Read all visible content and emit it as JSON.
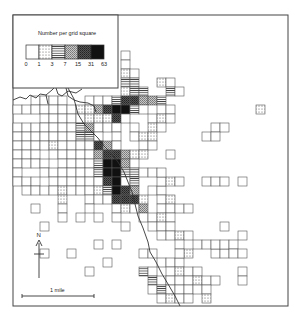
{
  "legend": {
    "title": "Number per grid square",
    "ticks": [
      "0",
      "1",
      "3",
      "7",
      "15",
      "31",
      "63"
    ],
    "classes": [
      {
        "range": "0",
        "pattern": "empty"
      },
      {
        "range": "1-3",
        "pattern": "dots"
      },
      {
        "range": "3-7",
        "pattern": "hlines"
      },
      {
        "range": "7-15",
        "pattern": "crosshatch-light"
      },
      {
        "range": "15-31",
        "pattern": "crosshatch-dark"
      },
      {
        "range": "31-63",
        "pattern": "solid"
      }
    ]
  },
  "north_label": "N",
  "scale_label": "1 mile",
  "grid": {
    "origin_x": 13,
    "origin_y": 15,
    "cell": 9,
    "cells": [
      [
        9,
        2,
        0
      ],
      [
        10,
        2,
        1
      ],
      [
        10,
        3,
        0
      ],
      [
        11,
        3,
        1
      ],
      [
        10,
        4,
        0
      ],
      [
        11,
        4,
        0
      ],
      [
        12,
        4,
        0
      ],
      [
        6,
        3,
        0
      ],
      [
        6,
        5,
        0
      ],
      [
        7,
        5,
        0
      ],
      [
        8,
        5,
        0
      ],
      [
        10,
        5,
        0
      ],
      [
        11,
        5,
        0
      ],
      [
        12,
        5,
        0
      ],
      [
        5,
        6,
        0
      ],
      [
        8,
        6,
        0
      ],
      [
        9,
        6,
        0
      ],
      [
        10,
        6,
        0
      ],
      [
        11,
        6,
        0
      ],
      [
        12,
        6,
        1
      ],
      [
        13,
        6,
        0
      ],
      [
        9,
        7,
        0
      ],
      [
        10,
        7,
        0
      ],
      [
        11,
        7,
        1
      ],
      [
        12,
        7,
        2
      ],
      [
        13,
        7,
        2
      ],
      [
        16,
        7,
        1
      ],
      [
        17,
        7,
        0
      ],
      [
        9,
        8,
        0
      ],
      [
        10,
        8,
        1
      ],
      [
        11,
        8,
        0
      ],
      [
        12,
        8,
        1
      ],
      [
        13,
        8,
        2
      ],
      [
        14,
        8,
        2
      ],
      [
        17,
        8,
        2
      ],
      [
        18,
        8,
        0
      ],
      [
        8,
        9,
        0
      ],
      [
        9,
        9,
        0
      ],
      [
        10,
        9,
        0
      ],
      [
        11,
        9,
        2
      ],
      [
        12,
        9,
        4
      ],
      [
        13,
        9,
        4
      ],
      [
        14,
        9,
        3
      ],
      [
        15,
        9,
        3
      ],
      [
        16,
        9,
        2
      ],
      [
        9,
        10,
        3
      ],
      [
        10,
        10,
        4
      ],
      [
        11,
        10,
        5
      ],
      [
        12,
        10,
        5
      ],
      [
        13,
        10,
        2
      ],
      [
        14,
        10,
        0
      ],
      [
        16,
        10,
        0
      ],
      [
        17,
        10,
        0
      ],
      [
        27,
        10,
        1
      ],
      [
        2,
        9,
        0
      ],
      [
        3,
        9,
        0
      ],
      [
        4,
        9,
        0
      ],
      [
        5,
        9,
        0
      ],
      [
        0,
        10,
        0
      ],
      [
        1,
        10,
        0
      ],
      [
        2,
        10,
        0
      ],
      [
        3,
        10,
        0
      ],
      [
        4,
        10,
        0
      ],
      [
        5,
        10,
        0
      ],
      [
        6,
        10,
        0
      ],
      [
        7,
        10,
        1
      ],
      [
        8,
        10,
        1
      ],
      [
        3,
        11,
        0
      ],
      [
        4,
        11,
        0
      ],
      [
        5,
        11,
        0
      ],
      [
        6,
        11,
        0
      ],
      [
        7,
        11,
        0
      ],
      [
        8,
        11,
        1
      ],
      [
        9,
        11,
        1
      ],
      [
        10,
        11,
        1
      ],
      [
        11,
        11,
        4
      ],
      [
        12,
        11,
        0
      ],
      [
        15,
        11,
        0
      ],
      [
        16,
        11,
        1
      ],
      [
        17,
        11,
        0
      ],
      [
        0,
        12,
        0
      ],
      [
        1,
        12,
        0
      ],
      [
        2,
        12,
        0
      ],
      [
        3,
        12,
        0
      ],
      [
        4,
        12,
        0
      ],
      [
        5,
        12,
        0
      ],
      [
        6,
        12,
        0
      ],
      [
        7,
        12,
        2
      ],
      [
        8,
        12,
        3
      ],
      [
        9,
        12,
        0
      ],
      [
        10,
        12,
        0
      ],
      [
        11,
        12,
        0
      ],
      [
        13,
        12,
        0
      ],
      [
        15,
        12,
        1
      ],
      [
        16,
        12,
        0
      ],
      [
        22,
        12,
        0
      ],
      [
        23,
        12,
        0
      ],
      [
        0,
        13,
        0
      ],
      [
        1,
        13,
        0
      ],
      [
        2,
        13,
        0
      ],
      [
        3,
        13,
        0
      ],
      [
        4,
        13,
        0
      ],
      [
        5,
        13,
        0
      ],
      [
        6,
        13,
        0
      ],
      [
        7,
        13,
        2
      ],
      [
        8,
        13,
        2
      ],
      [
        9,
        13,
        0
      ],
      [
        11,
        13,
        0
      ],
      [
        13,
        13,
        0
      ],
      [
        14,
        13,
        1
      ],
      [
        15,
        13,
        1
      ],
      [
        21,
        13,
        0
      ],
      [
        22,
        13,
        0
      ],
      [
        0,
        14,
        0
      ],
      [
        1,
        14,
        0
      ],
      [
        2,
        14,
        0
      ],
      [
        3,
        14,
        0
      ],
      [
        4,
        14,
        1
      ],
      [
        5,
        14,
        0
      ],
      [
        6,
        14,
        0
      ],
      [
        7,
        14,
        0
      ],
      [
        8,
        14,
        0
      ],
      [
        9,
        14,
        4
      ],
      [
        10,
        14,
        3
      ],
      [
        11,
        14,
        0
      ],
      [
        14,
        14,
        0
      ],
      [
        15,
        14,
        0
      ],
      [
        0,
        15,
        0
      ],
      [
        1,
        15,
        0
      ],
      [
        2,
        15,
        0
      ],
      [
        4,
        15,
        0
      ],
      [
        5,
        15,
        0
      ],
      [
        6,
        15,
        0
      ],
      [
        7,
        15,
        0
      ],
      [
        8,
        15,
        0
      ],
      [
        9,
        15,
        3
      ],
      [
        10,
        15,
        4
      ],
      [
        11,
        15,
        4
      ],
      [
        12,
        15,
        3
      ],
      [
        13,
        15,
        1
      ],
      [
        14,
        15,
        1
      ],
      [
        17,
        15,
        0
      ],
      [
        0,
        16,
        0
      ],
      [
        1,
        16,
        0
      ],
      [
        2,
        16,
        0
      ],
      [
        3,
        16,
        0
      ],
      [
        5,
        16,
        0
      ],
      [
        6,
        16,
        0
      ],
      [
        7,
        16,
        0
      ],
      [
        8,
        16,
        0
      ],
      [
        9,
        16,
        2
      ],
      [
        10,
        16,
        5
      ],
      [
        11,
        16,
        5
      ],
      [
        12,
        16,
        3
      ],
      [
        13,
        16,
        0
      ],
      [
        0,
        17,
        0
      ],
      [
        3,
        17,
        0
      ],
      [
        4,
        17,
        0
      ],
      [
        5,
        17,
        0
      ],
      [
        6,
        17,
        0
      ],
      [
        7,
        17,
        0
      ],
      [
        8,
        17,
        0
      ],
      [
        9,
        17,
        2
      ],
      [
        10,
        17,
        5
      ],
      [
        11,
        17,
        5
      ],
      [
        12,
        17,
        2
      ],
      [
        13,
        17,
        2
      ],
      [
        0,
        18,
        0
      ],
      [
        1,
        18,
        0
      ],
      [
        2,
        18,
        0
      ],
      [
        4,
        18,
        0
      ],
      [
        5,
        18,
        0
      ],
      [
        6,
        18,
        0
      ],
      [
        7,
        18,
        0
      ],
      [
        8,
        18,
        0
      ],
      [
        9,
        18,
        0
      ],
      [
        10,
        18,
        4
      ],
      [
        11,
        18,
        5
      ],
      [
        12,
        18,
        0
      ],
      [
        13,
        18,
        2
      ],
      [
        1,
        19,
        0
      ],
      [
        2,
        19,
        0
      ],
      [
        3,
        19,
        0
      ],
      [
        4,
        19,
        0
      ],
      [
        5,
        19,
        1
      ],
      [
        6,
        19,
        0
      ],
      [
        7,
        19,
        0
      ],
      [
        8,
        19,
        0
      ],
      [
        9,
        19,
        1
      ],
      [
        10,
        19,
        2
      ],
      [
        11,
        19,
        5
      ],
      [
        12,
        19,
        4
      ],
      [
        13,
        19,
        3
      ],
      [
        15,
        19,
        0
      ],
      [
        16,
        19,
        0
      ],
      [
        5,
        20,
        1
      ],
      [
        8,
        20,
        0
      ],
      [
        9,
        20,
        0
      ],
      [
        10,
        20,
        0
      ],
      [
        11,
        20,
        4
      ],
      [
        12,
        20,
        4
      ],
      [
        13,
        20,
        4
      ],
      [
        14,
        20,
        1
      ],
      [
        16,
        20,
        0
      ],
      [
        17,
        20,
        1
      ],
      [
        2,
        21,
        0
      ],
      [
        5,
        21,
        0
      ],
      [
        8,
        21,
        0
      ],
      [
        11,
        21,
        0
      ],
      [
        12,
        21,
        1
      ],
      [
        13,
        21,
        0
      ],
      [
        14,
        21,
        3
      ],
      [
        16,
        21,
        0
      ],
      [
        17,
        21,
        0
      ],
      [
        18,
        21,
        0
      ],
      [
        19,
        21,
        0
      ],
      [
        5,
        22,
        0
      ],
      [
        7,
        22,
        0
      ],
      [
        9,
        22,
        0
      ],
      [
        11,
        22,
        0
      ],
      [
        14,
        22,
        0
      ],
      [
        15,
        22,
        0
      ],
      [
        16,
        22,
        1
      ],
      [
        17,
        22,
        0
      ],
      [
        3,
        23,
        0
      ],
      [
        12,
        23,
        0
      ],
      [
        15,
        23,
        0
      ],
      [
        16,
        23,
        0
      ],
      [
        17,
        23,
        0
      ],
      [
        16,
        18,
        0
      ],
      [
        17,
        18,
        1
      ],
      [
        18,
        18,
        0
      ],
      [
        21,
        18,
        0
      ],
      [
        22,
        18,
        0
      ],
      [
        23,
        18,
        0
      ],
      [
        25,
        18,
        0
      ],
      [
        14,
        17,
        0
      ],
      [
        15,
        17,
        0
      ],
      [
        16,
        17,
        0
      ],
      [
        16,
        24,
        0
      ],
      [
        17,
        24,
        0
      ],
      [
        18,
        24,
        1
      ],
      [
        19,
        24,
        0
      ],
      [
        23,
        23,
        0
      ],
      [
        25,
        24,
        0
      ],
      [
        6,
        26,
        0
      ],
      [
        16,
        27,
        0
      ],
      [
        17,
        27,
        0
      ],
      [
        18,
        27,
        0
      ],
      [
        22,
        26,
        0
      ],
      [
        23,
        26,
        0
      ],
      [
        14,
        28,
        2
      ],
      [
        15,
        28,
        0
      ],
      [
        17,
        28,
        0
      ],
      [
        18,
        28,
        1
      ],
      [
        19,
        28,
        0
      ],
      [
        20,
        28,
        0
      ],
      [
        25,
        28,
        0
      ],
      [
        15,
        29,
        2
      ],
      [
        16,
        29,
        0
      ],
      [
        17,
        29,
        0
      ],
      [
        18,
        29,
        0
      ],
      [
        19,
        29,
        0
      ],
      [
        20,
        29,
        1
      ],
      [
        21,
        29,
        0
      ],
      [
        22,
        29,
        0
      ],
      [
        25,
        29,
        0
      ],
      [
        15,
        30,
        0
      ],
      [
        16,
        30,
        2
      ],
      [
        17,
        30,
        0
      ],
      [
        18,
        30,
        0
      ],
      [
        19,
        30,
        0
      ],
      [
        20,
        30,
        0
      ],
      [
        21,
        30,
        0
      ],
      [
        16,
        31,
        0
      ],
      [
        17,
        31,
        1
      ],
      [
        18,
        31,
        0
      ],
      [
        19,
        31,
        0
      ],
      [
        21,
        31,
        1
      ],
      [
        8,
        28,
        0
      ],
      [
        10,
        27,
        0
      ],
      [
        9,
        25,
        0
      ],
      [
        11,
        25,
        0
      ],
      [
        3,
        26,
        0
      ],
      [
        18,
        25,
        0
      ],
      [
        20,
        25,
        0
      ],
      [
        21,
        25,
        0
      ],
      [
        22,
        25,
        0
      ],
      [
        23,
        25,
        0
      ],
      [
        24,
        25,
        0
      ],
      [
        19,
        26,
        1
      ],
      [
        18,
        26,
        0
      ],
      [
        24,
        26,
        0
      ],
      [
        25,
        26,
        0
      ],
      [
        14,
        26,
        0
      ],
      [
        15,
        26,
        0
      ]
    ]
  }
}
